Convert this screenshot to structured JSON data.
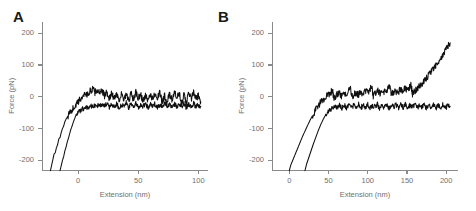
{
  "figure": {
    "background": "#ffffff",
    "trace_color": "#101010",
    "axis_color": "#8a8a8a",
    "text_color": "#6f6f6f"
  },
  "panels": [
    {
      "letter": "A",
      "xlabel": "Extension (nm)",
      "ylabel": "Force (pN)",
      "xticks": [
        0,
        50,
        100
      ],
      "yticks": [
        200,
        100,
        0,
        -100,
        -200
      ],
      "xlim": [
        -30,
        108
      ],
      "ylim": [
        -230,
        235
      ]
    },
    {
      "letter": "B",
      "xlabel": "Extension (nm)",
      "ylabel": "Force (pN)",
      "xticks": [
        0,
        50,
        100,
        150,
        200
      ],
      "yticks": [
        200,
        100,
        0,
        -100,
        -200
      ],
      "xlim": [
        -22,
        215
      ],
      "ylim": [
        -230,
        235
      ]
    }
  ],
  "chart_data": [
    {
      "type": "line",
      "title": "A",
      "xlabel": "Extension (nm)",
      "ylabel": "Force (pN)",
      "xlim": [
        -30,
        108
      ],
      "ylim": [
        -230,
        235
      ],
      "xticks": [
        0,
        50,
        100
      ],
      "yticks": [
        200,
        100,
        0,
        -100,
        -200
      ],
      "grid": false,
      "legend": "none",
      "series": [
        {
          "name": "approach",
          "comment": "steep rise from below -200 pN near x=-22, plateaus with noise around 0 to +20 pN",
          "x": [
            -23,
            -22,
            -21,
            -20,
            -19,
            -18,
            -17,
            -16,
            -15,
            -14,
            -13,
            -12,
            -11,
            -10,
            -8,
            -6,
            -4,
            -2,
            0,
            2,
            4,
            6,
            8,
            10,
            12,
            14,
            16,
            18,
            20,
            22,
            24,
            26,
            28,
            30,
            32,
            34,
            36,
            38,
            40,
            42,
            44,
            46,
            48,
            50,
            52,
            54,
            56,
            58,
            60,
            62,
            64,
            66,
            68,
            70,
            72,
            74,
            76,
            78,
            80,
            82,
            84,
            86,
            88,
            90,
            92,
            94,
            96,
            98,
            100,
            102
          ],
          "y": [
            -232,
            -215,
            -198,
            -180,
            -176,
            -160,
            -150,
            -132,
            -128,
            -112,
            -100,
            -92,
            -78,
            -70,
            -58,
            -44,
            -36,
            -26,
            -18,
            -6,
            2,
            12,
            6,
            18,
            24,
            14,
            22,
            10,
            18,
            4,
            14,
            -4,
            10,
            -6,
            12,
            -10,
            8,
            -12,
            6,
            -14,
            10,
            -8,
            14,
            -6,
            8,
            -14,
            4,
            -16,
            10,
            -8,
            14,
            -4,
            12,
            -16,
            6,
            -18,
            8,
            -12,
            16,
            -6,
            10,
            -16,
            4,
            -18,
            12,
            -8,
            14,
            -10,
            6,
            -16
          ]
        },
        {
          "name": "retract",
          "comment": "steep rise from below -200 pN near x=-14, settles into noisy plateau near -25 pN",
          "x": [
            -15,
            -14,
            -13,
            -12,
            -11,
            -10,
            -9,
            -8,
            -7,
            -6,
            -5,
            -4,
            -3,
            -2,
            0,
            2,
            4,
            6,
            8,
            10,
            12,
            14,
            16,
            18,
            20,
            22,
            24,
            26,
            28,
            30,
            32,
            34,
            36,
            38,
            40,
            42,
            44,
            46,
            48,
            50,
            52,
            54,
            56,
            58,
            60,
            62,
            64,
            66,
            68,
            70,
            72,
            74,
            76,
            78,
            80,
            82,
            84,
            86,
            88,
            90,
            92,
            94,
            96,
            98,
            100,
            102
          ],
          "y": [
            -232,
            -216,
            -200,
            -188,
            -170,
            -158,
            -142,
            -130,
            -116,
            -102,
            -92,
            -80,
            -70,
            -60,
            -50,
            -42,
            -38,
            -34,
            -32,
            -30,
            -28,
            -30,
            -26,
            -30,
            -24,
            -30,
            -22,
            -32,
            -24,
            -30,
            -22,
            -34,
            -26,
            -30,
            -20,
            -34,
            -24,
            -30,
            -22,
            -32,
            -26,
            -30,
            -20,
            -34,
            -24,
            -30,
            -22,
            -32,
            -26,
            -28,
            -20,
            -34,
            -24,
            -30,
            -22,
            -32,
            -26,
            -30,
            -20,
            -34,
            -24,
            -28,
            -22,
            -32,
            -26,
            -30
          ]
        }
      ]
    },
    {
      "type": "line",
      "title": "B",
      "xlabel": "Extension (nm)",
      "ylabel": "Force (pN)",
      "xlim": [
        -22,
        215
      ],
      "ylim": [
        -230,
        235
      ],
      "xticks": [
        0,
        50,
        100,
        150,
        200
      ],
      "yticks": [
        200,
        100,
        0,
        -100,
        -200
      ],
      "grid": false,
      "legend": "none",
      "series": [
        {
          "name": "unfolding-sawtooth",
          "comment": "rise from below -200 pN at x=0, sawtooth peaks near 55, 80, 105, 128, 155 nm, then final steep rise to about +170 pN at 205 nm",
          "x": [
            0,
            2,
            5,
            8,
            11,
            14,
            17,
            20,
            23,
            26,
            29,
            32,
            35,
            38,
            41,
            44,
            47,
            50,
            53,
            55,
            57,
            60,
            63,
            66,
            69,
            72,
            75,
            78,
            80,
            82,
            85,
            88,
            91,
            94,
            97,
            100,
            103,
            105,
            107,
            110,
            113,
            116,
            119,
            122,
            125,
            128,
            130,
            132,
            135,
            138,
            141,
            144,
            147,
            150,
            153,
            155,
            157,
            160,
            163,
            166,
            169,
            172,
            175,
            178,
            181,
            184,
            187,
            190,
            193,
            196,
            199,
            202,
            205
          ],
          "y": [
            -232,
            -214,
            -196,
            -178,
            -160,
            -142,
            -124,
            -108,
            -92,
            -76,
            -62,
            -48,
            -36,
            -24,
            -14,
            -6,
            2,
            8,
            14,
            20,
            -4,
            6,
            12,
            2,
            14,
            8,
            18,
            26,
            0,
            8,
            14,
            6,
            16,
            10,
            20,
            14,
            24,
            32,
            4,
            12,
            18,
            10,
            20,
            14,
            24,
            30,
            6,
            14,
            20,
            12,
            22,
            16,
            26,
            20,
            30,
            38,
            10,
            18,
            26,
            34,
            42,
            50,
            58,
            68,
            78,
            88,
            98,
            110,
            122,
            134,
            146,
            158,
            170
          ]
        },
        {
          "name": "baseline-retract",
          "comment": "rise from below -200 pN at x=20, flat noisy baseline near -28 pN across full range",
          "x": [
            20,
            22,
            25,
            28,
            31,
            34,
            37,
            40,
            43,
            46,
            49,
            52,
            55,
            58,
            61,
            64,
            67,
            70,
            73,
            76,
            79,
            82,
            85,
            88,
            91,
            94,
            97,
            100,
            103,
            106,
            109,
            112,
            115,
            118,
            121,
            124,
            127,
            130,
            133,
            136,
            139,
            142,
            145,
            148,
            151,
            154,
            157,
            160,
            163,
            166,
            169,
            172,
            175,
            178,
            181,
            184,
            187,
            190,
            193,
            196,
            199,
            202,
            205
          ],
          "y": [
            -232,
            -212,
            -190,
            -168,
            -146,
            -126,
            -106,
            -88,
            -72,
            -58,
            -48,
            -40,
            -34,
            -30,
            -34,
            -24,
            -36,
            -26,
            -34,
            -22,
            -36,
            -26,
            -32,
            -22,
            -36,
            -26,
            -34,
            -24,
            -36,
            -26,
            -32,
            -22,
            -36,
            -26,
            -34,
            -24,
            -36,
            -26,
            -32,
            -22,
            -36,
            -26,
            -34,
            -24,
            -36,
            -26,
            -32,
            -22,
            -36,
            -26,
            -34,
            -24,
            -36,
            -26,
            -32,
            -22,
            -36,
            -26,
            -34,
            -24,
            -36,
            -26,
            -30
          ]
        }
      ]
    }
  ]
}
